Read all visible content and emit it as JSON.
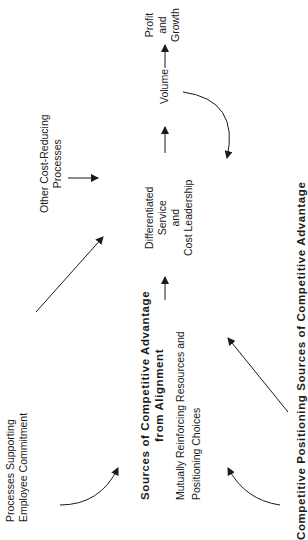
{
  "nodes": {
    "profit": {
      "lines": [
        "Profit",
        "and",
        "Growth"
      ]
    },
    "volume": {
      "label": "Volume"
    },
    "differentiated": {
      "lines": [
        "Differentiated",
        "Service",
        "and",
        "Cost Leadership"
      ]
    },
    "other_cost": {
      "lines": [
        "Other Cost-Reducing",
        "Processes"
      ]
    },
    "alignment": {
      "title_lines": [
        "Sources of Competitive Advantage",
        "from Alignment"
      ],
      "sub_lines": [
        "Mutually Reinforcing Resources and",
        "Positioning Choices"
      ]
    },
    "employee": {
      "lines": [
        "Processes Supporting",
        "Employee Commitment"
      ]
    },
    "positioning": {
      "label": "Competitive Positioning Sources of Competitive Advantage"
    }
  },
  "edges": [
    {
      "from": "volume",
      "to": "profit"
    },
    {
      "from": "differentiated",
      "to": "volume"
    },
    {
      "from": "volume",
      "to": "differentiated",
      "curved": true
    },
    {
      "from": "alignment",
      "to": "differentiated"
    },
    {
      "from": "other_cost",
      "to": "differentiated"
    },
    {
      "from": "employee",
      "to": "differentiated"
    },
    {
      "from": "employee",
      "to": "alignment",
      "curved": true
    },
    {
      "from": "positioning",
      "to": "alignment",
      "curved": true
    },
    {
      "from": "positioning",
      "to": "differentiated"
    }
  ],
  "colors": {
    "ink": "#1a1a1a",
    "background": "#ffffff"
  }
}
